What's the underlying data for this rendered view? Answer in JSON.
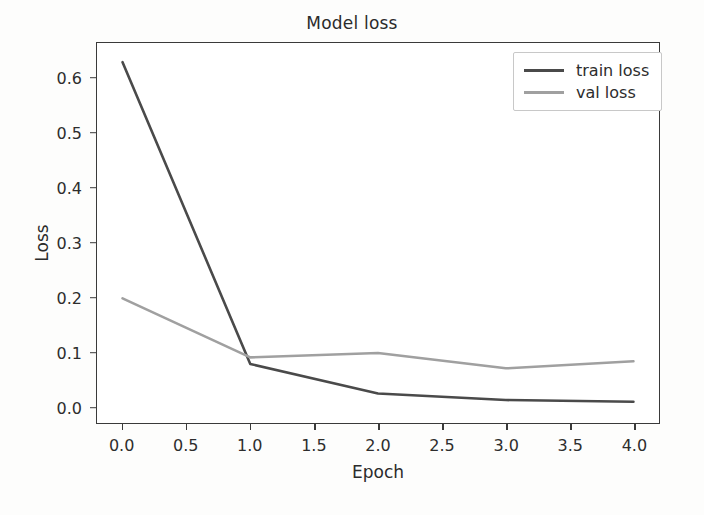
{
  "chart_data": {
    "type": "line",
    "title": "Model loss",
    "xlabel": "Epoch",
    "ylabel": "Loss",
    "x": [
      0,
      1,
      2,
      3,
      4
    ],
    "xlim": [
      -0.2,
      4.2
    ],
    "ylim": [
      -0.03,
      0.665
    ],
    "xticks": [
      0.0,
      0.5,
      1.0,
      1.5,
      2.0,
      2.5,
      3.0,
      3.5,
      4.0
    ],
    "xtick_labels": [
      "0.0",
      "0.5",
      "1.0",
      "1.5",
      "2.0",
      "2.5",
      "3.0",
      "3.5",
      "4.0"
    ],
    "yticks": [
      0.0,
      0.1,
      0.2,
      0.3,
      0.4,
      0.5,
      0.6
    ],
    "ytick_labels": [
      "0.0",
      "0.1",
      "0.2",
      "0.3",
      "0.4",
      "0.5",
      "0.6"
    ],
    "grid": false,
    "legend_position": "upper right",
    "series": [
      {
        "name": "train loss",
        "color": "#4a4a4a",
        "values": [
          0.63,
          0.078,
          0.024,
          0.012,
          0.009
        ]
      },
      {
        "name": "val loss",
        "color": "#a0a0a0",
        "values": [
          0.198,
          0.09,
          0.098,
          0.07,
          0.083
        ]
      }
    ]
  },
  "legend": {
    "items": [
      {
        "label": "train loss"
      },
      {
        "label": "val loss"
      }
    ]
  },
  "colors": {
    "axis": "#3a3a3a",
    "text": "#2d2d2d",
    "background": "#ffffff",
    "train": "#4a4a4a",
    "val": "#a0a0a0"
  }
}
